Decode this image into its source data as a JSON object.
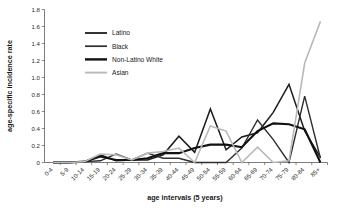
{
  "chart_data": {
    "type": "line",
    "title": "",
    "xlabel": "age intervals (5 years)",
    "ylabel": "age-specific incidence rate",
    "categories": [
      "0-4",
      "5-9",
      "10-14",
      "15-19",
      "20-24",
      "25-29",
      "30-34",
      "35-39",
      "40-44",
      "45-49",
      "50-54",
      "55-59",
      "60-64",
      "65-69",
      "70-74",
      "75-79",
      "80-84",
      "85+"
    ],
    "ylim": [
      0,
      1.8
    ],
    "yticks": [
      "0",
      "0.2",
      "0.4",
      "0.6",
      "0.8",
      "1.0",
      "1.2",
      "1.4",
      "1.6",
      "1.8"
    ],
    "ytick_values": [
      0,
      0.2,
      0.4,
      0.6,
      0.8,
      1.0,
      1.2,
      1.4,
      1.6,
      1.8
    ],
    "grid": false,
    "legend_position": "upper-left-inside",
    "series": [
      {
        "name": "Latino",
        "color": "#1c1c1c",
        "width": 1.5,
        "values": [
          0,
          0,
          0.01,
          0.09,
          0.02,
          0.03,
          0.03,
          0.09,
          0.31,
          0.12,
          0.63,
          0.15,
          0.3,
          0.35,
          0.59,
          0.92,
          0.37,
          0.06
        ]
      },
      {
        "name": "Black",
        "color": "#2e2e2e",
        "width": 1.4,
        "values": [
          0,
          0,
          0.01,
          0.02,
          0.1,
          0.03,
          0.11,
          0.05,
          0.05,
          0.0,
          0.0,
          0.0,
          0.17,
          0.5,
          0.27,
          0.0,
          0.78,
          0.05
        ]
      },
      {
        "name": "Non-Latino White",
        "color": "#111111",
        "width": 2.1,
        "values": [
          0,
          0,
          0.01,
          0.07,
          0.03,
          0.03,
          0.05,
          0.11,
          0.11,
          0.17,
          0.21,
          0.21,
          0.18,
          0.37,
          0.46,
          0.45,
          0.39,
          0.0
        ]
      },
      {
        "name": "Asian",
        "color": "#b9b9b9",
        "width": 1.6,
        "values": [
          0,
          0,
          0.01,
          0.1,
          0.09,
          0.03,
          0.11,
          0.13,
          0.17,
          0.0,
          0.43,
          0.37,
          0.0,
          0.18,
          0.0,
          0.02,
          1.17,
          1.66
        ]
      }
    ]
  },
  "legend": {
    "items": [
      {
        "label": "Latino"
      },
      {
        "label": "Black"
      },
      {
        "label": "Non-Latino White"
      },
      {
        "label": "Asian"
      }
    ]
  }
}
